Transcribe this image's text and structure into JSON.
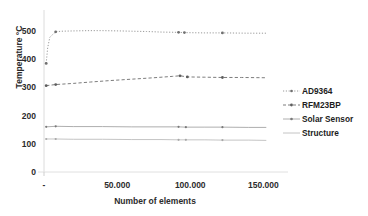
{
  "chart_data": {
    "type": "line",
    "title": "",
    "xlabel": "Number of elements",
    "ylabel": "Temperature °C",
    "xlim": [
      0,
      160000
    ],
    "ylim": [
      0,
      560
    ],
    "grid": false,
    "legend_position": "right",
    "x_ticks": [
      {
        "value": 0,
        "label": "-"
      },
      {
        "value": 50000,
        "label": "50.000"
      },
      {
        "value": 100000,
        "label": "100.000"
      },
      {
        "value": 150000,
        "label": "150.000"
      }
    ],
    "y_ticks": [
      {
        "value": 0,
        "label": "0"
      },
      {
        "value": 100,
        "label": "100"
      },
      {
        "value": 200,
        "label": "200"
      },
      {
        "value": 300,
        "label": "300"
      },
      {
        "value": 400,
        "label": "400"
      },
      {
        "value": 500,
        "label": "500"
      }
    ],
    "series": [
      {
        "name": "AD9364",
        "color": "#9a9a9a",
        "style": "dotted",
        "x": [
          1500,
          2500,
          4000,
          8000,
          12000,
          20000,
          30000,
          40000,
          52000,
          60000,
          70000,
          80000,
          92000,
          96000,
          110000,
          122000,
          140000,
          152000
        ],
        "values": [
          385,
          440,
          478,
          497,
          499,
          500,
          501,
          501,
          500,
          499,
          498,
          496,
          495,
          494,
          493,
          493,
          492,
          492
        ]
      },
      {
        "name": "RFM23BP",
        "color": "#7d7d7d",
        "style": "dashed",
        "x": [
          1500,
          8000,
          20000,
          32000,
          45000,
          60000,
          75000,
          88000,
          93000,
          98000,
          110000,
          122000,
          135000,
          152000
        ],
        "values": [
          306,
          310,
          314,
          319,
          324,
          329,
          334,
          339,
          341,
          337,
          336,
          335,
          335,
          334
        ]
      },
      {
        "name": "Solar Sensor",
        "color": "#a5a5a5",
        "style": "solid",
        "x": [
          1500,
          8000,
          20000,
          40000,
          60000,
          80000,
          92000,
          97000,
          110000,
          122000,
          140000,
          152000
        ],
        "values": [
          160,
          162,
          161,
          161,
          160,
          160,
          160,
          159,
          159,
          159,
          158,
          158
        ]
      },
      {
        "name": "Structure",
        "color": "#bdbdbd",
        "style": "solid",
        "x": [
          1500,
          8000,
          20000,
          40000,
          60000,
          80000,
          92000,
          97000,
          110000,
          122000,
          140000,
          152000
        ],
        "values": [
          117,
          117,
          116,
          116,
          115,
          115,
          114,
          114,
          114,
          113,
          113,
          112
        ]
      }
    ]
  },
  "legend": {
    "items": [
      {
        "label": "AD9364"
      },
      {
        "label": "RFM23BP"
      },
      {
        "label": "Solar Sensor"
      },
      {
        "label": "Structure"
      }
    ]
  }
}
